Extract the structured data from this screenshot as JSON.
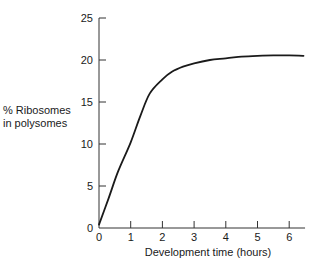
{
  "chart_data": {
    "type": "line",
    "title": "",
    "xlabel": "Development time (hours)",
    "ylabel": "% Ribosomes in polysomes",
    "ylabel_lines": [
      "% Ribosomes",
      "in polysomes"
    ],
    "xlim": [
      0,
      6.5
    ],
    "ylim": [
      0,
      25
    ],
    "xticks": [
      0,
      1,
      2,
      3,
      4,
      5,
      6
    ],
    "yticks": [
      0,
      5,
      10,
      15,
      20,
      25
    ],
    "grid": false,
    "legend": null,
    "series": [
      {
        "name": "% Ribosomes in polysomes",
        "x": [
          0,
          0.3,
          0.6,
          1.0,
          1.3,
          1.6,
          2.0,
          2.3,
          2.65,
          3.0,
          3.5,
          4.0,
          4.5,
          5.0,
          5.5,
          6.0,
          6.45
        ],
        "y": [
          0.4,
          3.5,
          6.7,
          10.2,
          13.3,
          16.0,
          17.7,
          18.6,
          19.2,
          19.6,
          20.0,
          20.2,
          20.4,
          20.5,
          20.55,
          20.55,
          20.5
        ]
      }
    ]
  }
}
